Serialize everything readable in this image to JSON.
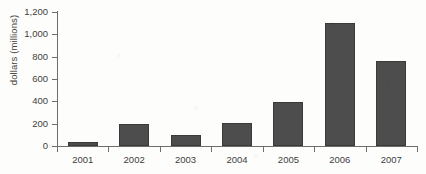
{
  "chart_data": {
    "type": "bar",
    "title": "",
    "xlabel": "",
    "ylabel": "dollars (millions)",
    "categories": [
      "2001",
      "2002",
      "2003",
      "2004",
      "2005",
      "2006",
      "2007"
    ],
    "values": [
      40,
      200,
      100,
      210,
      390,
      1100,
      760
    ],
    "series": [
      {
        "name": "dollars (millions)",
        "values": [
          40,
          200,
          100,
          210,
          390,
          1100,
          760
        ]
      }
    ],
    "ylim": [
      0,
      1200
    ],
    "ytick_values": [
      0,
      200,
      400,
      600,
      800,
      1000,
      1200
    ],
    "ytick_labels": [
      "0",
      "200",
      "400",
      "600",
      "800",
      "1,000",
      "1,200"
    ],
    "grid": false,
    "legend": false,
    "legend_position": "none",
    "bar_color": "#4d4d4d",
    "bar_border_color": "#3a3a3a",
    "axis_color": "#6e6e6e",
    "text_color": "#3d3d3d",
    "background_color": "#fdfdfc"
  }
}
